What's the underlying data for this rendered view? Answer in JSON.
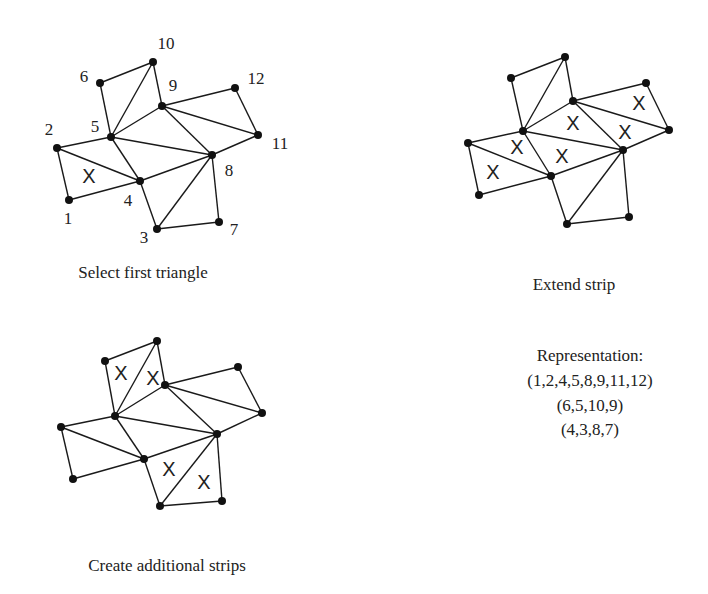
{
  "figure": {
    "panels": [
      {
        "id": "select-first-triangle",
        "caption": "Select first triangle",
        "caption_pos": [
          143,
          278
        ],
        "show_labels": true,
        "vertices": {
          "1": [
            69,
            200
          ],
          "2": [
            57,
            148
          ],
          "3": [
            157,
            229
          ],
          "4": [
            140,
            181
          ],
          "5": [
            111,
            137
          ],
          "6": [
            100,
            83
          ],
          "7": [
            219,
            222
          ],
          "8": [
            212,
            155
          ],
          "9": [
            162,
            106
          ],
          "10": [
            153,
            62
          ],
          "11": [
            258,
            135
          ],
          "12": [
            235,
            88
          ]
        },
        "label_pos": {
          "1": [
            68,
            224
          ],
          "2": [
            49,
            135
          ],
          "3": [
            144,
            243
          ],
          "4": [
            128,
            206
          ],
          "5": [
            95,
            132
          ],
          "6": [
            84,
            82
          ],
          "7": [
            234,
            235
          ],
          "8": [
            229,
            176
          ],
          "9": [
            173,
            91
          ],
          "10": [
            166,
            49
          ],
          "11": [
            280,
            149
          ],
          "12": [
            256,
            84
          ]
        },
        "marks": [
          [
            89,
            176
          ]
        ]
      },
      {
        "id": "extend-strip",
        "caption": "Extend strip",
        "caption_pos": [
          574,
          290
        ],
        "show_labels": false,
        "vertices": {
          "1": [
            479,
            195
          ],
          "2": [
            468,
            143
          ],
          "3": [
            567,
            224
          ],
          "4": [
            551,
            176
          ],
          "5": [
            523,
            131
          ],
          "6": [
            511,
            78
          ],
          "7": [
            629,
            217
          ],
          "8": [
            623,
            150
          ],
          "9": [
            573,
            101
          ],
          "10": [
            565,
            57
          ],
          "11": [
            669,
            130
          ],
          "12": [
            646,
            83
          ]
        },
        "label_pos": {},
        "marks": [
          [
            493,
            172
          ],
          [
            517,
            147
          ],
          [
            562,
            156
          ],
          [
            573,
            123
          ],
          [
            625,
            132
          ],
          [
            639,
            103
          ]
        ]
      },
      {
        "id": "create-additional-strips",
        "caption": "Create additional strips",
        "caption_pos": [
          167,
          571
        ],
        "show_labels": false,
        "vertices": {
          "1": [
            73,
            479
          ],
          "2": [
            61,
            427
          ],
          "3": [
            160,
            506
          ],
          "4": [
            144,
            459
          ],
          "5": [
            115,
            416
          ],
          "6": [
            105,
            361
          ],
          "7": [
            222,
            501
          ],
          "8": [
            217,
            434
          ],
          "9": [
            165,
            385
          ],
          "10": [
            157,
            341
          ],
          "11": [
            262,
            413
          ],
          "12": [
            238,
            367
          ]
        },
        "label_pos": {},
        "marks": [
          [
            121,
            373
          ],
          [
            153,
            378
          ],
          [
            169,
            469
          ],
          [
            204,
            482
          ]
        ]
      }
    ],
    "edges": [
      [
        "1",
        "2"
      ],
      [
        "1",
        "4"
      ],
      [
        "2",
        "4"
      ],
      [
        "2",
        "5"
      ],
      [
        "4",
        "5"
      ],
      [
        "5",
        "6"
      ],
      [
        "6",
        "10"
      ],
      [
        "5",
        "10"
      ],
      [
        "10",
        "9"
      ],
      [
        "5",
        "9"
      ],
      [
        "5",
        "8"
      ],
      [
        "4",
        "8"
      ],
      [
        "9",
        "8"
      ],
      [
        "9",
        "12"
      ],
      [
        "9",
        "11"
      ],
      [
        "12",
        "11"
      ],
      [
        "11",
        "8"
      ],
      [
        "4",
        "3"
      ],
      [
        "3",
        "8"
      ],
      [
        "3",
        "7"
      ],
      [
        "7",
        "8"
      ]
    ],
    "mark_symbol": "X",
    "representation": {
      "title": "Representation:",
      "strips": [
        "(1,2,4,5,8,9,11,12)",
        "(6,5,10,9)",
        "(4,3,8,7)"
      ],
      "center_x": 590,
      "line_y": [
        361,
        386,
        411,
        435
      ]
    }
  }
}
